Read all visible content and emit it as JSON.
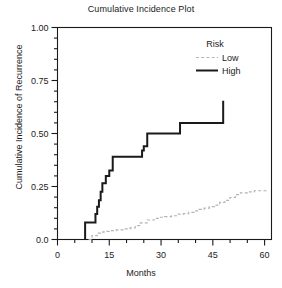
{
  "chart_data": {
    "type": "line",
    "title": "Cumulative Incidence Plot",
    "xlabel": "Months",
    "ylabel": "Cumulative Incidence of Recurrence",
    "xlim": [
      0,
      62
    ],
    "ylim": [
      0,
      1.0
    ],
    "grid": false,
    "step": "post",
    "xticks": [
      0,
      15,
      30,
      45,
      60
    ],
    "xtick_labels": [
      "0",
      "15",
      "30",
      "45",
      "60"
    ],
    "xminor_step": 5,
    "yticks": [
      0.0,
      0.25,
      0.5,
      0.75,
      1.0
    ],
    "ytick_labels": [
      "0.0",
      "0.25",
      "0.50",
      "0.75",
      "1.00"
    ],
    "yminor_step": 0.05,
    "legend": {
      "title": "Risk",
      "position": "top-right",
      "entries": [
        {
          "name": "Low",
          "color": "#b4b4b4",
          "style": "dashed"
        },
        {
          "name": "High",
          "color": "#1a1a1a",
          "style": "solid"
        }
      ]
    },
    "series": [
      {
        "name": "High",
        "color": "#1a1a1a",
        "style": "solid",
        "width": 2.0,
        "x": [
          8,
          8,
          10.5,
          11,
          11.5,
          12,
          12.5,
          13,
          14,
          15,
          16,
          21,
          24.5,
          25,
          26,
          35.5,
          48,
          48
        ],
        "y": [
          0.0,
          0.08,
          0.08,
          0.12,
          0.155,
          0.185,
          0.225,
          0.265,
          0.3,
          0.325,
          0.39,
          0.39,
          0.42,
          0.44,
          0.5,
          0.55,
          0.55,
          0.655
        ]
      },
      {
        "name": "Low",
        "color": "#b4b4b4",
        "style": "dashed",
        "width": 1.2,
        "x": [
          9,
          10,
          11.5,
          12.5,
          13.5,
          15,
          17,
          19,
          21,
          22.5,
          24,
          26,
          28,
          29.5,
          31,
          33,
          35,
          36.5,
          38,
          39.5,
          41,
          42.5,
          44,
          45.5,
          47,
          48.5,
          50,
          51.5,
          53,
          55,
          57,
          60.5
        ],
        "y": [
          0.0,
          0.018,
          0.03,
          0.035,
          0.038,
          0.042,
          0.045,
          0.05,
          0.055,
          0.065,
          0.078,
          0.092,
          0.1,
          0.105,
          0.108,
          0.112,
          0.12,
          0.122,
          0.128,
          0.135,
          0.142,
          0.148,
          0.155,
          0.162,
          0.175,
          0.185,
          0.198,
          0.212,
          0.22,
          0.225,
          0.23,
          0.235
        ]
      }
    ]
  }
}
